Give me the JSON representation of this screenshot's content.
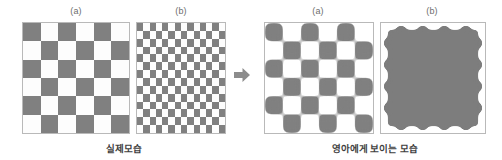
{
  "figure": {
    "width": 502,
    "height": 160,
    "background": "#ffffff",
    "colors": {
      "dark_square": "#808080",
      "light_square": "#fdfdfd",
      "panel_border": "#b9b9b9",
      "label_text": "#6d6d6d",
      "caption_text": "#3f3f3f",
      "arrow": "#8c8c8c"
    }
  },
  "groups": [
    {
      "id": "actual-appearance",
      "caption": "실제모습",
      "panels": [
        {
          "id": "coarse-checkerboard",
          "label": "(a)",
          "type": "checkerboard",
          "rows": 6,
          "cols": 6,
          "start_dark": true
        },
        {
          "id": "fine-checkerboard",
          "label": "(b)",
          "type": "checkerboard",
          "rows": 14,
          "cols": 14,
          "start_dark": true
        }
      ]
    },
    {
      "id": "infant-appearance",
      "caption": "영아에게 보이는 모습",
      "panels": [
        {
          "id": "blurred-coarse-checkerboard",
          "label": "(a)",
          "type": "blurred-mesh",
          "holes_rows": 3,
          "holes_cols": 3
        },
        {
          "id": "blurred-fine-checkerboard",
          "label": "(b)",
          "type": "blurred-solid"
        }
      ]
    }
  ],
  "arrow": {
    "id": "transform-arrow",
    "direction": "right",
    "glyph": "arrow-right-icon"
  }
}
